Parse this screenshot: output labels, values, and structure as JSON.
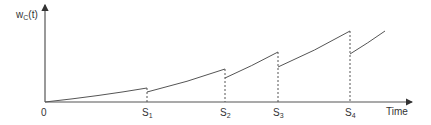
{
  "diagram": {
    "type": "sawtooth-growth-curve",
    "y_axis_label": {
      "main": "w",
      "sub": "C",
      "suffix": "(t)"
    },
    "x_axis_label": "Time",
    "origin_label": "0",
    "ticks": [
      {
        "main": "S",
        "sub": "1"
      },
      {
        "main": "S",
        "sub": "2"
      },
      {
        "main": "S",
        "sub": "3"
      },
      {
        "main": "S",
        "sub": "4"
      }
    ],
    "colors": {
      "line": "#555555",
      "text": "#333333"
    }
  }
}
